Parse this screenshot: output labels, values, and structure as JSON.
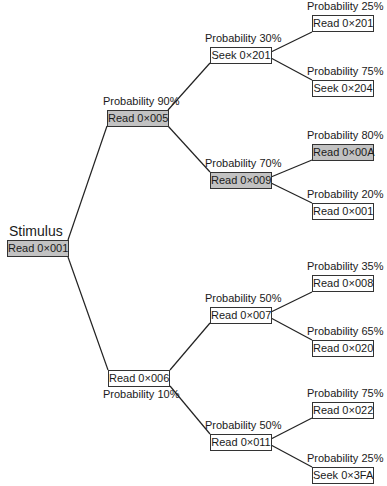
{
  "diagram": {
    "root": {
      "title": "Stimulus",
      "label": "Read 0×001",
      "highlighted": true
    },
    "level1": [
      {
        "id": "n005",
        "label": "Read 0×005",
        "probability": "Probability 90%",
        "highlighted": true
      },
      {
        "id": "n006",
        "label": "Read 0×006",
        "probability": "Probability 10%",
        "highlighted": false
      }
    ],
    "level2": [
      {
        "id": "s201",
        "parent": "n005",
        "label": "Seek 0×201",
        "probability": "Probability 30%",
        "highlighted": false
      },
      {
        "id": "n009",
        "parent": "n005",
        "label": "Read 0×009",
        "probability": "Probability 70%",
        "highlighted": true
      },
      {
        "id": "n007",
        "parent": "n006",
        "label": "Read 0×007",
        "probability": "Probability 50%",
        "highlighted": false
      },
      {
        "id": "n011",
        "parent": "n006",
        "label": "Read 0×011",
        "probability": "Probability 50%",
        "highlighted": false
      }
    ],
    "level3": [
      {
        "parent": "s201",
        "label": "Read 0×201",
        "probability": "Probability 25%",
        "highlighted": false
      },
      {
        "parent": "s201",
        "label": "Seek 0×204",
        "probability": "Probability 75%",
        "highlighted": false
      },
      {
        "parent": "n009",
        "label": "Read 0×00A",
        "probability": "Probability 80%",
        "highlighted": true
      },
      {
        "parent": "n009",
        "label": "Read 0×001",
        "probability": "Probability 20%",
        "highlighted": false
      },
      {
        "parent": "n007",
        "label": "Read 0×008",
        "probability": "Probability 35%",
        "highlighted": false
      },
      {
        "parent": "n007",
        "label": "Read 0×020",
        "probability": "Probability 65%",
        "highlighted": false
      },
      {
        "parent": "n011",
        "label": "Read 0×022",
        "probability": "Probability 75%",
        "highlighted": false
      },
      {
        "parent": "n011",
        "label": "Seek 0×3FA",
        "probability": "Probability 25%",
        "highlighted": false
      }
    ],
    "colors": {
      "highlight_fill": "#c2c2c2",
      "node_fill": "#ffffff",
      "line": "#222222"
    }
  }
}
